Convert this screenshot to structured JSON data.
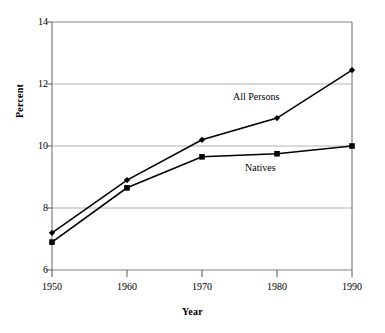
{
  "chart_data": {
    "type": "line",
    "title": "",
    "xlabel": "Year",
    "ylabel": "Percent",
    "x": [
      1950,
      1960,
      1970,
      1980,
      1990
    ],
    "xlim": [
      1950,
      1990
    ],
    "ylim": [
      6,
      14
    ],
    "xticks": [
      "1950",
      "1960",
      "1970",
      "1980",
      "1990"
    ],
    "yticks": [
      "6",
      "8",
      "10",
      "12",
      "14"
    ],
    "grid": "horizontal",
    "legend_position": "inline-annotations",
    "series": [
      {
        "name": "All Persons",
        "label": "All Persons",
        "color": "#000000",
        "marker": "diamond",
        "values": [
          7.2,
          8.9,
          10.2,
          10.9,
          12.45
        ]
      },
      {
        "name": "Natives",
        "label": "Natives",
        "color": "#000000",
        "marker": "square",
        "values": [
          6.9,
          8.65,
          9.65,
          9.75,
          10.0
        ]
      }
    ],
    "annotations": [
      {
        "text": "All Persons",
        "x": 1973,
        "y": 11.5
      },
      {
        "text": "Natives",
        "x": 1978,
        "y": 9.2
      }
    ]
  },
  "axis": {
    "y_title": "Percent",
    "x_title": "Year"
  }
}
